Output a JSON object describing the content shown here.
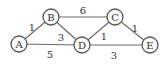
{
  "graph": {
    "nodes": [
      {
        "id": "A",
        "label": "A",
        "x": 19,
        "y": 44
      },
      {
        "id": "B",
        "label": "B",
        "x": 51,
        "y": 17
      },
      {
        "id": "C",
        "label": "C",
        "x": 115,
        "y": 17
      },
      {
        "id": "D",
        "label": "D",
        "x": 82,
        "y": 45
      },
      {
        "id": "E",
        "label": "E",
        "x": 150,
        "y": 45
      }
    ],
    "edges": [
      {
        "from": "A",
        "to": "B",
        "weight": "1"
      },
      {
        "from": "B",
        "to": "C",
        "weight": "6"
      },
      {
        "from": "B",
        "to": "D",
        "weight": "3"
      },
      {
        "from": "A",
        "to": "D",
        "weight": "5"
      },
      {
        "from": "C",
        "to": "D",
        "weight": "1"
      },
      {
        "from": "C",
        "to": "E",
        "weight": "1"
      },
      {
        "from": "D",
        "to": "E",
        "weight": "3"
      }
    ]
  }
}
